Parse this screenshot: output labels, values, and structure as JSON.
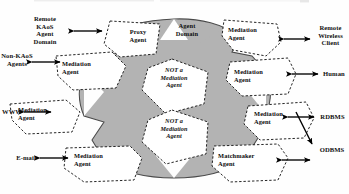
{
  "diagram": {
    "colors": {
      "domain_fill": "#b3b3b3",
      "domain_stroke": "#4a4a4a",
      "node_fill": "#ffffff",
      "node_stroke": "#1a1a1a",
      "arrow": "#000000",
      "text": "#0d0d0d",
      "background": "#ffffff"
    },
    "central_region": {
      "name": "agent-domain-region",
      "label": "Agent\nDomain"
    },
    "nodes": [
      {
        "id": "proxy-agent",
        "label": "Proxy\nAgent",
        "kind": "agent"
      },
      {
        "id": "agent-domain",
        "label": "Agent\nDomain",
        "kind": "region-label"
      },
      {
        "id": "mediation-agent-1",
        "label": "Mediation\nAgent",
        "kind": "agent"
      },
      {
        "id": "mediation-agent-2",
        "label": "Mediation\nAgent",
        "kind": "agent"
      },
      {
        "id": "mediation-agent-3",
        "label": "Mediation\nAgent",
        "kind": "agent"
      },
      {
        "id": "mediation-agent-4",
        "label": "Mediation\nAgent",
        "kind": "agent"
      },
      {
        "id": "mediation-agent-5",
        "label": "Mediation\nAgent",
        "kind": "agent"
      },
      {
        "id": "mediation-agent-6",
        "label": "Mediation\nAgent",
        "kind": "agent"
      },
      {
        "id": "matchmaker-agent",
        "label": "Matchmaker\nAgent",
        "kind": "agent"
      },
      {
        "id": "not-mediation-1",
        "label": "NOT a\nMediation\nAgent",
        "kind": "non-mediation"
      },
      {
        "id": "not-mediation-2",
        "label": "NOT a\nMediation\nAgent",
        "kind": "non-mediation"
      }
    ],
    "external_entities": [
      {
        "id": "remote-kaos-agent-domain",
        "label": "Remote\nKAoS\nAgent\nDomain",
        "side": "left",
        "arrow": "double"
      },
      {
        "id": "non-kaos-agents",
        "label": "Non-KAoS\nAgents",
        "side": "left",
        "arrow": "double"
      },
      {
        "id": "www",
        "label": "WWW",
        "side": "left",
        "arrow": "double"
      },
      {
        "id": "e-mail",
        "label": "E-mail",
        "side": "left",
        "arrow": "double"
      },
      {
        "id": "remote-wireless-client",
        "label": "Remote\nWireless\nClient",
        "side": "right",
        "arrow": "double"
      },
      {
        "id": "human",
        "label": "Human",
        "side": "right",
        "arrow": "double"
      },
      {
        "id": "rdbms",
        "label": "RDBMS",
        "side": "right",
        "arrow": "double"
      },
      {
        "id": "odbms",
        "label": "ODBMS",
        "side": "right",
        "arrow": "single"
      }
    ]
  }
}
